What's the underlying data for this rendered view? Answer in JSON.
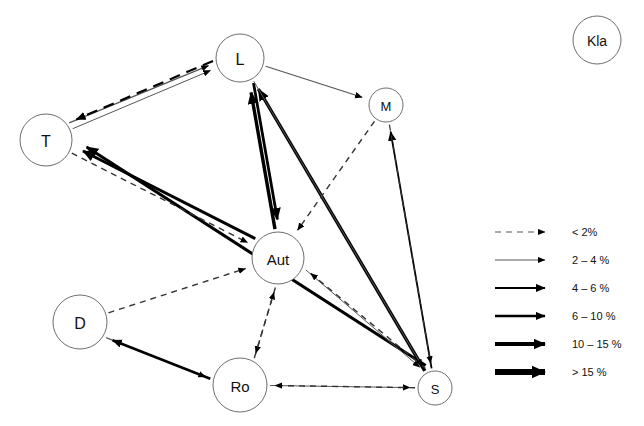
{
  "diagram": {
    "background_color": "#ffffff",
    "node_stroke_color": "#6e6e6e",
    "edge_color": "#000000",
    "thin_edge_color": "#555555",
    "nodes": [
      {
        "id": "L",
        "label": "L",
        "cx": 240,
        "cy": 58,
        "r": 24,
        "font_size": 16
      },
      {
        "id": "T",
        "label": "T",
        "cx": 46,
        "cy": 140,
        "r": 26,
        "font_size": 16
      },
      {
        "id": "M",
        "label": "M",
        "cx": 386,
        "cy": 105,
        "r": 17,
        "font_size": 13
      },
      {
        "id": "Aut",
        "label": "Aut",
        "cx": 278,
        "cy": 258,
        "r": 26,
        "font_size": 15
      },
      {
        "id": "D",
        "label": "D",
        "cx": 80,
        "cy": 322,
        "r": 27,
        "font_size": 16
      },
      {
        "id": "Ro",
        "label": "Ro",
        "cx": 240,
        "cy": 385,
        "r": 27,
        "font_size": 15
      },
      {
        "id": "S",
        "label": "S",
        "cx": 435,
        "cy": 388,
        "r": 17,
        "font_size": 13
      },
      {
        "id": "Kla",
        "label": "Kla",
        "cx": 597,
        "cy": 40,
        "r": 24,
        "font_size": 14
      }
    ],
    "edges": [
      {
        "from": "T",
        "to": "L",
        "weight_class": "2 – 4 %",
        "style": "solid",
        "width": 1.2,
        "name": "edge-t-to-l"
      },
      {
        "from": "L",
        "to": "T",
        "weight_class": "4 – 6 %",
        "style": "dashed",
        "width": 2.2,
        "name": "edge-l-to-t"
      },
      {
        "from": "L",
        "to": "M",
        "weight_class": "2 – 4 %",
        "style": "solid",
        "width": 1.2,
        "name": "edge-l-to-m"
      },
      {
        "from": "S",
        "to": "M",
        "weight_class": "4 – 6 %",
        "style": "solid",
        "width": 1.8,
        "name": "edge-s-to-m"
      },
      {
        "from": "S",
        "to": "L",
        "weight_class": "10 – 15 %",
        "style": "solid",
        "width": 3.4,
        "name": "edge-s-to-l"
      },
      {
        "from": "Aut",
        "to": "L",
        "weight_class": "10 – 15 %",
        "style": "solid",
        "width": 3.4,
        "name": "edge-aut-to-l"
      },
      {
        "from": "L",
        "to": "Aut",
        "weight_class": "6 – 10 %",
        "style": "solid",
        "width": 2.8,
        "name": "edge-l-to-aut"
      },
      {
        "from": "T",
        "to": "L",
        "weight_class": "2 – 4 %",
        "style": "solid",
        "width": 1.0,
        "name": "edge-t-low-to-l"
      },
      {
        "from": "M",
        "to": "Aut",
        "weight_class": "< 2%",
        "style": "dashed",
        "width": 1.4,
        "name": "edge-m-to-aut"
      },
      {
        "from": "Aut",
        "to": "T",
        "weight_class": "10 – 15 %",
        "style": "solid",
        "width": 3.0,
        "name": "edge-aut-to-t"
      },
      {
        "from": "S",
        "to": "T",
        "weight_class": "10 – 15 %",
        "style": "solid",
        "width": 3.0,
        "name": "edge-s-to-t"
      },
      {
        "from": "T",
        "to": "Aut",
        "weight_class": "< 2%",
        "style": "dashed",
        "width": 1.4,
        "name": "edge-t-to-aut"
      },
      {
        "from": "D",
        "to": "Aut",
        "weight_class": "< 2%",
        "style": "dashed",
        "width": 1.4,
        "name": "edge-d-to-aut"
      },
      {
        "from": "Aut",
        "to": "Ro",
        "weight_class": "< 2%",
        "style": "dashed",
        "width": 1.4,
        "name": "edge-aut-to-ro"
      },
      {
        "from": "Ro",
        "to": "Aut",
        "weight_class": "< 2%",
        "style": "dashed",
        "width": 1.4,
        "name": "edge-ro-to-aut"
      },
      {
        "from": "Aut",
        "to": "S",
        "weight_class": "2 – 4 %",
        "style": "solid",
        "width": 1.0,
        "name": "edge-aut-to-s"
      },
      {
        "from": "S",
        "to": "Aut",
        "weight_class": "< 2%",
        "style": "dashed",
        "width": 1.4,
        "name": "edge-s-to-aut"
      },
      {
        "from": "Ro",
        "to": "S",
        "weight_class": "2 – 4 %",
        "style": "solid",
        "width": 1.0,
        "name": "edge-ro-to-s"
      },
      {
        "from": "S",
        "to": "Ro",
        "weight_class": "< 2%",
        "style": "dashed",
        "width": 1.4,
        "name": "edge-s-to-ro"
      },
      {
        "from": "D",
        "to": "Ro",
        "weight_class": "2 – 4 %",
        "style": "solid",
        "width": 1.2,
        "name": "edge-d-to-ro"
      },
      {
        "from": "Ro",
        "to": "D",
        "weight_class": "6 – 10 %",
        "style": "solid",
        "width": 2.6,
        "name": "edge-ro-to-d"
      },
      {
        "from": "M",
        "to": "S",
        "weight_class": "< 2%",
        "style": "dashed",
        "width": 1.2,
        "name": "edge-m-to-s"
      },
      {
        "from": "L",
        "to": "S",
        "weight_class": "2 – 4 %",
        "style": "solid",
        "width": 1.0,
        "name": "edge-l-to-s"
      }
    ]
  },
  "legend": {
    "x": 495,
    "y": 232,
    "row_height": 28,
    "line_length": 60,
    "items": [
      {
        "label": "< 2%",
        "style": "dashed",
        "width": 1.2,
        "arrow": "small",
        "color": "#555555"
      },
      {
        "label": "2 – 4 %",
        "style": "solid",
        "width": 1.0,
        "arrow": "small",
        "color": "#555555"
      },
      {
        "label": "4 – 6 %",
        "style": "solid",
        "width": 1.8,
        "arrow": "medium",
        "color": "#000000"
      },
      {
        "label": "6 – 10 %",
        "style": "solid",
        "width": 2.6,
        "arrow": "medium",
        "color": "#000000"
      },
      {
        "label": "10 – 15 %",
        "style": "solid",
        "width": 4.0,
        "arrow": "large",
        "color": "#000000"
      },
      {
        "label": "> 15 %",
        "style": "solid",
        "width": 6.0,
        "arrow": "xlarge",
        "color": "#000000"
      }
    ]
  }
}
